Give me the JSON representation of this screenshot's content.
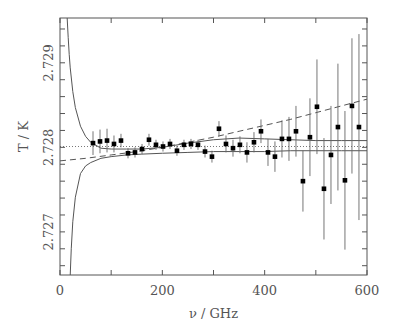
{
  "chart_data": {
    "type": "scatter",
    "title": "",
    "xlabel": "ν / GHz",
    "ylabel": "T / K",
    "xlim": [
      0,
      600
    ],
    "ylim": [
      2.72649,
      2.72953
    ],
    "grid": false,
    "legend": "none",
    "x_ticks": [
      0,
      200,
      400,
      600
    ],
    "x_tick_labels": [
      "0",
      "200",
      "400",
      "600"
    ],
    "x_minor_step": 100,
    "y_ticks": [
      2.727,
      2.728,
      2.729
    ],
    "y_tick_labels": [
      "2.727",
      "2.728",
      "2.729"
    ],
    "y_minor_step": 0.0002,
    "reference_temperature": 2.72801,
    "series": [
      {
        "name": "measurements",
        "kind": "errorbar",
        "x": [
          64.5,
          78.2,
          91.9,
          105.5,
          119.2,
          132.9,
          146.6,
          160.3,
          173.9,
          187.6,
          201.3,
          215.0,
          228.6,
          242.3,
          256.0,
          269.7,
          283.4,
          297.0,
          310.7,
          324.4,
          338.1,
          351.7,
          365.4,
          379.1,
          392.8,
          406.5,
          420.1,
          433.8,
          447.5,
          461.2,
          474.8,
          488.5,
          502.2,
          515.9,
          529.6,
          543.2,
          556.9,
          570.6,
          584.3
        ],
        "y": [
          2.72805,
          2.72807,
          2.72808,
          2.72804,
          2.72808,
          2.72793,
          2.72794,
          2.72798,
          2.72809,
          2.72803,
          2.72801,
          2.72804,
          2.72796,
          2.72803,
          2.72804,
          2.72803,
          2.72795,
          2.72789,
          2.72822,
          2.72804,
          2.72799,
          2.72803,
          2.72794,
          2.72806,
          2.72819,
          2.72794,
          2.72789,
          2.7281,
          2.7281,
          2.72819,
          2.7276,
          2.72812,
          2.72848,
          2.72751,
          2.72791,
          2.72824,
          2.72761,
          2.72849,
          2.72824
        ],
        "err": [
          0.00014,
          0.00014,
          0.00014,
          0.0001,
          8e-05,
          6e-05,
          6e-05,
          6e-05,
          7e-05,
          6e-05,
          6e-05,
          6e-05,
          6e-05,
          6e-05,
          6e-05,
          6e-05,
          7e-05,
          7e-05,
          9e-05,
          0.0001,
          0.0001,
          0.0001,
          0.00012,
          0.00012,
          0.00014,
          0.00016,
          0.00018,
          0.00022,
          0.00026,
          0.0003,
          0.00036,
          0.00046,
          0.00056,
          0.0006,
          0.00058,
          0.00075,
          0.00082,
          0.0008,
          0.0011
        ]
      },
      {
        "name": "upper bound",
        "kind": "line",
        "style": "solid",
        "x": [
          14,
          16,
          18,
          20,
          25,
          30,
          40,
          50,
          60,
          80,
          100,
          130,
          160,
          200,
          250,
          300,
          350,
          400,
          450,
          500,
          550,
          600
        ],
        "y": [
          2.72953,
          2.7293,
          2.7291,
          2.72894,
          2.72866,
          2.72847,
          2.72825,
          2.72813,
          2.72806,
          2.72799,
          2.72798,
          2.72798,
          2.72798,
          2.728,
          2.72805,
          2.72809,
          2.72811,
          2.7281,
          2.72809,
          2.72808,
          2.72808,
          2.72808
        ]
      },
      {
        "name": "lower bound",
        "kind": "line",
        "style": "solid",
        "x": [
          20,
          22,
          25,
          30,
          40,
          50,
          60,
          80,
          100,
          130,
          160,
          200,
          250,
          300,
          350,
          400,
          450,
          500,
          550,
          600
        ],
        "y": [
          2.72649,
          2.7268,
          2.72712,
          2.72741,
          2.72769,
          2.72778,
          2.72782,
          2.72787,
          2.72789,
          2.72791,
          2.72792,
          2.72793,
          2.72794,
          2.72795,
          2.72795,
          2.72795,
          2.72796,
          2.72796,
          2.72796,
          2.72796
        ]
      },
      {
        "name": "fit",
        "kind": "line",
        "style": "dashed",
        "x": [
          0,
          50,
          100,
          150,
          200,
          250,
          300,
          350,
          400,
          450,
          500,
          550,
          600
        ],
        "y": [
          2.72784,
          2.72787,
          2.72791,
          2.72795,
          2.728,
          2.72806,
          2.72812,
          2.72819,
          2.72826,
          2.72833,
          2.72841,
          2.72849,
          2.72857
        ]
      },
      {
        "name": "mean",
        "kind": "line",
        "style": "dotted",
        "x": [
          0,
          600
        ],
        "y": [
          2.72801,
          2.72801
        ]
      }
    ]
  }
}
